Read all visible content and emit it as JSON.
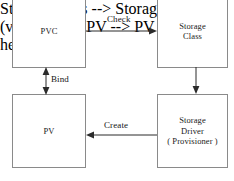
{
  "diagram": {
    "canvas": {
      "width": 234,
      "height": 181,
      "background": "#ffffff"
    },
    "style": {
      "node_border_color": "#8a8a8a",
      "node_fill": "#ffffff",
      "edge_color": "#2b2b2b",
      "text_color": "#1a1a1a"
    },
    "nodes": [
      {
        "id": "pvc",
        "lines": [
          "PVC"
        ],
        "x": 12,
        "y": -6,
        "width": 74,
        "height": 74
      },
      {
        "id": "storage-class",
        "lines": [
          "Storage",
          "Class"
        ],
        "x": 157,
        "y": -6,
        "width": 71,
        "height": 74
      },
      {
        "id": "pv",
        "lines": [
          "PV"
        ],
        "x": 12,
        "y": 94,
        "width": 74,
        "height": 74
      },
      {
        "id": "storage-driver",
        "lines": [
          "Storage",
          "Driver",
          "( Provisioner )"
        ],
        "x": 157,
        "y": 94,
        "width": 71,
        "height": 74
      }
    ],
    "edges": [
      {
        "id": "check",
        "label": "Check",
        "from": "pvc",
        "to": "storage-class",
        "direction": "right",
        "arrowheads": "end"
      },
      {
        "id": "class-to-driver",
        "label": "",
        "from": "storage-class",
        "to": "storage-driver",
        "direction": "down",
        "arrowheads": "end"
      },
      {
        "id": "create",
        "label": "Create",
        "from": "storage-driver",
        "to": "pv",
        "direction": "left",
        "arrowheads": "end"
      },
      {
        "id": "bind",
        "label": "Bind",
        "from": "pvc",
        "to": "pv",
        "direction": "vertical",
        "arrowheads": "both"
      }
    ]
  }
}
